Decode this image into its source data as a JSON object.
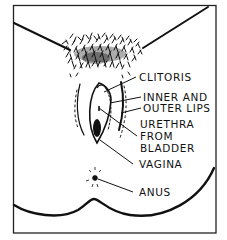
{
  "diagram": {
    "type": "anatomical line drawing",
    "colors": {
      "ink": "#111111",
      "background": "#ffffff"
    },
    "labels": [
      {
        "id": "clitoris",
        "text": "CLITORIS"
      },
      {
        "id": "lips_1",
        "text": "INNER AND"
      },
      {
        "id": "lips_2",
        "text": "OUTER LIPS"
      },
      {
        "id": "urethra_1",
        "text": "URETHRA"
      },
      {
        "id": "urethra_2",
        "text": "FROM"
      },
      {
        "id": "urethra_3",
        "text": "BLADDER"
      },
      {
        "id": "vagina",
        "text": "VAGINA"
      },
      {
        "id": "anus",
        "text": "ANUS"
      }
    ]
  }
}
